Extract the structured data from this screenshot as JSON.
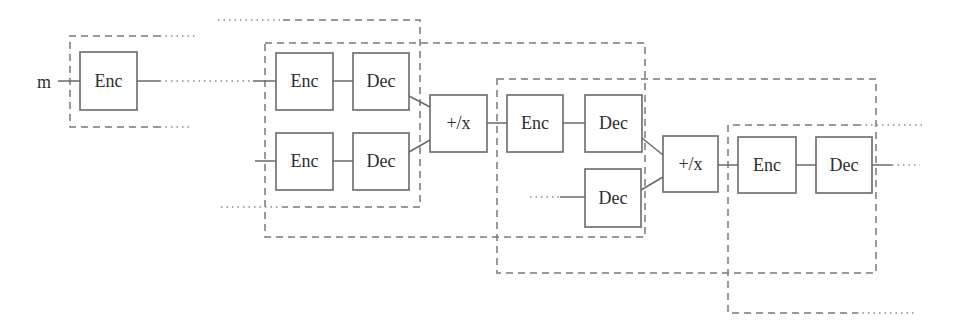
{
  "diagram": {
    "input_label": "m",
    "colors": {
      "background": "#ffffff",
      "box_stroke": "#6a6a6a",
      "region_stroke": "#7a7a7a",
      "text": "#2e2e2e"
    }
  },
  "nodes": [
    {
      "id": "enc-1",
      "label": "Enc"
    },
    {
      "id": "enc-2a",
      "label": "Enc"
    },
    {
      "id": "dec-2a",
      "label": "Dec"
    },
    {
      "id": "enc-2b",
      "label": "Enc"
    },
    {
      "id": "dec-2b",
      "label": "Dec"
    },
    {
      "id": "combine-1",
      "label": "+/x"
    },
    {
      "id": "enc-3",
      "label": "Enc"
    },
    {
      "id": "dec-3a",
      "label": "Dec"
    },
    {
      "id": "dec-3b",
      "label": "Dec"
    },
    {
      "id": "combine-2",
      "label": "+/x"
    },
    {
      "id": "enc-4",
      "label": "Enc"
    },
    {
      "id": "dec-4",
      "label": "Dec"
    }
  ]
}
